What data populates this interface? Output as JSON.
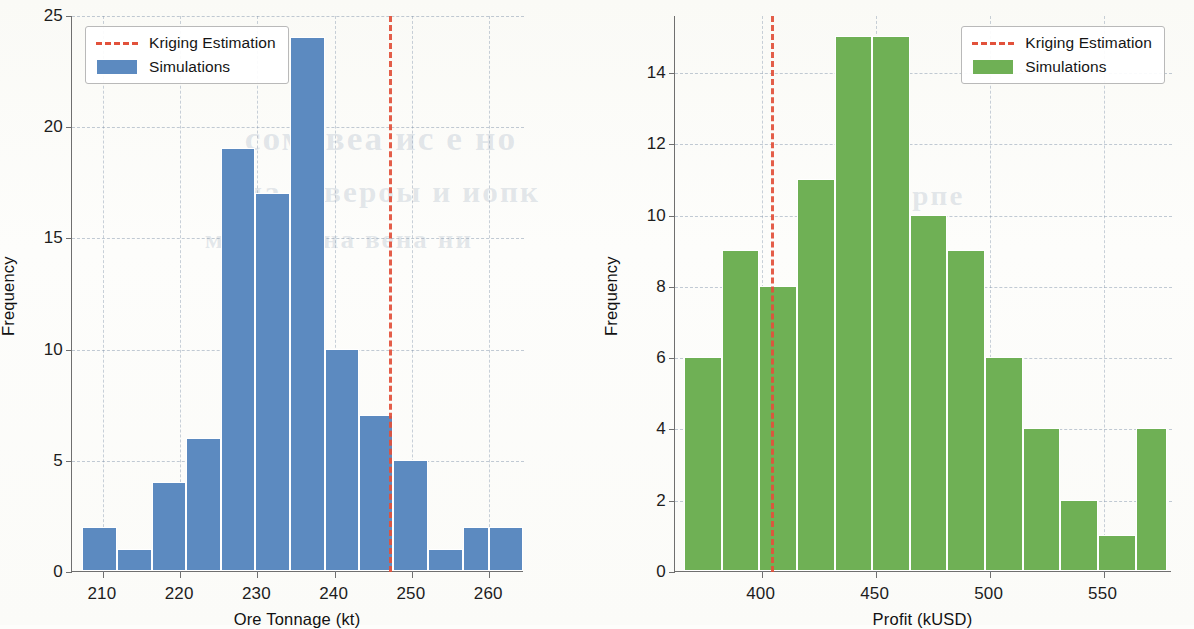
{
  "background": {
    "paper_color": "#fdfdfb",
    "bleed_through_text": [
      {
        "text": "сомевеа ис е но",
        "x": 250,
        "y": 120,
        "size": 34
      },
      {
        "text": "ниа эовероы и иопк",
        "x": 230,
        "y": 175,
        "size": 30
      },
      {
        "text": "мика го на вена ни",
        "x": 210,
        "y": 225,
        "size": 26
      },
      {
        "text": "ипорпе",
        "x": 860,
        "y": 180,
        "size": 28
      }
    ]
  },
  "chart_data": [
    {
      "id": "ore-tonnage-histogram",
      "type": "bar",
      "title": "",
      "xlabel": "Ore Tonnage (kt)",
      "ylabel": "Frequency",
      "xlim": [
        206.0,
        264.5
      ],
      "ylim": [
        0,
        25
      ],
      "xticks": [
        210,
        220,
        230,
        240,
        250,
        260
      ],
      "yticks": [
        0,
        5,
        10,
        15,
        20,
        25
      ],
      "grid": true,
      "bar_color": "#5c8ac0",
      "bin_edges": [
        207.3,
        211.8,
        216.3,
        220.8,
        225.3,
        229.7,
        234.2,
        238.7,
        243.2,
        247.6,
        252.1,
        256.6,
        260.0,
        264.4
      ],
      "values": [
        2,
        1,
        4,
        6,
        19,
        17,
        24,
        10,
        7,
        5,
        1,
        2,
        2
      ],
      "annotations": [
        {
          "name": "kriging-estimation-line",
          "type": "vline",
          "x": 247.0,
          "color": "#e2513b",
          "style": "dashed"
        }
      ],
      "legend": {
        "position": "upper left",
        "entries": [
          {
            "label": "Kriging Estimation",
            "marker": "dashed-line",
            "color": "#e2513b"
          },
          {
            "label": "Simulations",
            "marker": "swatch",
            "color": "#5c8ac0"
          }
        ]
      }
    },
    {
      "id": "profit-histogram",
      "type": "bar",
      "title": "",
      "xlabel": "Profit (kUSD)",
      "ylabel": "Frequency",
      "xlim": [
        362.0,
        580.0
      ],
      "ylim": [
        0,
        15.6
      ],
      "xticks": [
        400,
        450,
        500,
        550
      ],
      "yticks": [
        0,
        2,
        4,
        6,
        8,
        10,
        12,
        14
      ],
      "grid": true,
      "bar_color": "#6fb055",
      "bin_edges": [
        366.0,
        382.5,
        399.0,
        415.5,
        432.0,
        448.5,
        465.0,
        481.5,
        498.0,
        514.5,
        531.0,
        547.5,
        564.0,
        578.0
      ],
      "values": [
        6,
        9,
        8,
        11,
        15,
        15,
        10,
        9,
        6,
        4,
        2,
        1,
        4
      ],
      "annotations": [
        {
          "name": "kriging-estimation-line",
          "type": "vline",
          "x": 404.0,
          "color": "#e2513b",
          "style": "dashed"
        }
      ],
      "legend": {
        "position": "upper right",
        "entries": [
          {
            "label": "Kriging Estimation",
            "marker": "dashed-line",
            "color": "#e2513b"
          },
          {
            "label": "Simulations",
            "marker": "swatch",
            "color": "#6fb055"
          }
        ]
      }
    }
  ]
}
